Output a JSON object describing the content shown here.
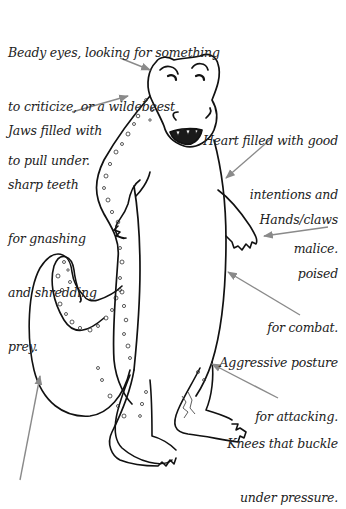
{
  "colors": {
    "background": "#ffffff",
    "ink": "#111111",
    "text": "#222222",
    "arrow": "#8a8a8a"
  },
  "annotations": {
    "eyes": {
      "lines": [
        "Beady eyes, looking for something",
        "to criticize, or a wildebeest",
        "to pull under."
      ]
    },
    "jaws": {
      "lines": [
        "Jaws filled with",
        "sharp teeth",
        "for gnashing",
        "and shredding",
        "prey."
      ]
    },
    "heart": {
      "lines": [
        "Heart filled with good",
        "intentions and",
        "malice."
      ]
    },
    "hands": {
      "lines": [
        "Hands/claws",
        "poised",
        "for combat."
      ]
    },
    "posture": {
      "lines": [
        "Aggressive posture",
        "for attacking."
      ]
    },
    "knees": {
      "lines": [
        "Knees that buckle",
        "under pressure."
      ]
    }
  },
  "figure": {
    "arrows": [
      {
        "name": "eyes-arrow",
        "from": [
          120,
          60
        ],
        "to": [
          150,
          70
        ]
      },
      {
        "name": "jaws-arrow",
        "from": [
          72,
          112
        ],
        "to": [
          128,
          96
        ]
      },
      {
        "name": "heart-arrow",
        "from": [
          272,
          138
        ],
        "to": [
          226,
          178
        ]
      },
      {
        "name": "hands-arrow",
        "from": [
          328,
          227
        ],
        "to": [
          263,
          236
        ]
      },
      {
        "name": "posture-arrow",
        "from": [
          300,
          315
        ],
        "to": [
          228,
          272
        ]
      },
      {
        "name": "knees-arrow",
        "from": [
          278,
          398
        ],
        "to": [
          212,
          364
        ]
      },
      {
        "name": "tail-arrow",
        "from": [
          20,
          478
        ],
        "to": [
          40,
          374
        ]
      }
    ]
  }
}
